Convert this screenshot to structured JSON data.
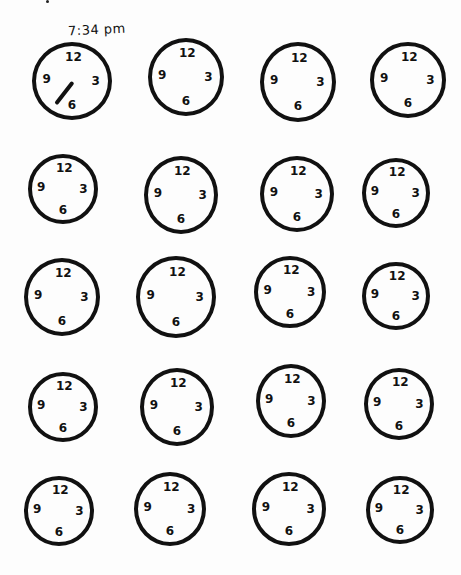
{
  "worksheet": {
    "title_label": "7:34 pm",
    "grid": {
      "rows": 5,
      "columns": 4
    },
    "colors": {
      "ink": "#111111",
      "paper": "#fdfdfd"
    },
    "clocks": [
      {
        "row": 1,
        "col": 1,
        "x": 32,
        "y": 42,
        "w": 80,
        "h": 78,
        "numerals": {
          "12": "12",
          "3": "3",
          "6": "6",
          "9": "9"
        },
        "time": "7:34 pm",
        "has_hand": true
      },
      {
        "row": 1,
        "col": 2,
        "x": 148,
        "y": 38,
        "w": 76,
        "h": 78,
        "numerals": {
          "12": "12",
          "3": "3",
          "6": "6",
          "9": "9"
        }
      },
      {
        "row": 1,
        "col": 3,
        "x": 260,
        "y": 42,
        "w": 76,
        "h": 80,
        "numerals": {
          "12": "12",
          "3": "3",
          "6": "6",
          "9": "9"
        }
      },
      {
        "row": 1,
        "col": 4,
        "x": 370,
        "y": 42,
        "w": 76,
        "h": 76,
        "numerals": {
          "12": "12",
          "3": "3",
          "6": "6",
          "9": "9"
        }
      },
      {
        "row": 2,
        "col": 1,
        "x": 28,
        "y": 154,
        "w": 70,
        "h": 70,
        "numerals": {
          "12": "12",
          "3": "3",
          "6": "6",
          "9": "9"
        }
      },
      {
        "row": 2,
        "col": 2,
        "x": 144,
        "y": 156,
        "w": 74,
        "h": 78,
        "numerals": {
          "12": "12",
          "3": "3",
          "6": "6",
          "9": "9"
        }
      },
      {
        "row": 2,
        "col": 3,
        "x": 260,
        "y": 156,
        "w": 74,
        "h": 76,
        "numerals": {
          "12": "12",
          "3": "3",
          "6": "6",
          "9": "9"
        }
      },
      {
        "row": 2,
        "col": 4,
        "x": 362,
        "y": 158,
        "w": 68,
        "h": 70,
        "numerals": {
          "12": "12",
          "3": "3",
          "6": "6",
          "9": "9"
        }
      },
      {
        "row": 3,
        "col": 1,
        "x": 24,
        "y": 258,
        "w": 76,
        "h": 78,
        "numerals": {
          "12": "12",
          "3": "3",
          "6": "6",
          "9": "9"
        }
      },
      {
        "row": 3,
        "col": 2,
        "x": 136,
        "y": 256,
        "w": 80,
        "h": 82,
        "numerals": {
          "12": "12",
          "3": "3",
          "6": "6",
          "9": "9"
        }
      },
      {
        "row": 3,
        "col": 3,
        "x": 254,
        "y": 256,
        "w": 72,
        "h": 72,
        "numerals": {
          "12": "12",
          "3": "3",
          "6": "6",
          "9": "9"
        }
      },
      {
        "row": 3,
        "col": 4,
        "x": 362,
        "y": 262,
        "w": 68,
        "h": 68,
        "numerals": {
          "12": "12",
          "3": "3",
          "6": "6",
          "9": "9"
        }
      },
      {
        "row": 4,
        "col": 1,
        "x": 28,
        "y": 372,
        "w": 70,
        "h": 70,
        "numerals": {
          "12": "12",
          "3": "3",
          "6": "6",
          "9": "9"
        }
      },
      {
        "row": 4,
        "col": 2,
        "x": 140,
        "y": 368,
        "w": 74,
        "h": 78,
        "numerals": {
          "12": "12",
          "3": "3",
          "6": "6",
          "9": "9"
        }
      },
      {
        "row": 4,
        "col": 3,
        "x": 256,
        "y": 364,
        "w": 70,
        "h": 74,
        "numerals": {
          "12": "12",
          "3": "3",
          "6": "6",
          "9": "9"
        }
      },
      {
        "row": 4,
        "col": 4,
        "x": 364,
        "y": 368,
        "w": 70,
        "h": 72,
        "numerals": {
          "12": "12",
          "3": "3",
          "6": "6",
          "9": "9"
        }
      },
      {
        "row": 5,
        "col": 1,
        "x": 24,
        "y": 476,
        "w": 70,
        "h": 70,
        "numerals": {
          "12": "12",
          "3": "3",
          "6": "6",
          "9": "9"
        }
      },
      {
        "row": 5,
        "col": 2,
        "x": 134,
        "y": 472,
        "w": 72,
        "h": 74,
        "numerals": {
          "12": "12",
          "3": "3",
          "6": "6",
          "9": "9"
        }
      },
      {
        "row": 5,
        "col": 3,
        "x": 252,
        "y": 472,
        "w": 74,
        "h": 74,
        "numerals": {
          "12": "12",
          "3": "3",
          "6": "6",
          "9": "9"
        }
      },
      {
        "row": 5,
        "col": 4,
        "x": 366,
        "y": 476,
        "w": 68,
        "h": 68,
        "numerals": {
          "12": "12",
          "3": "3",
          "6": "6",
          "9": "9"
        }
      }
    ]
  }
}
